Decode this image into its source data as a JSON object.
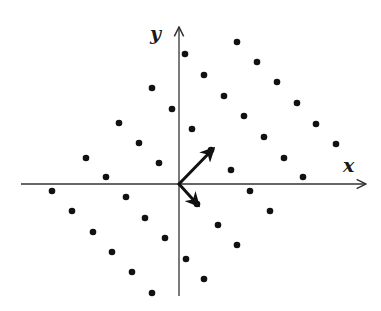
{
  "diagram": {
    "type": "lattice",
    "axes": {
      "x_label": "x",
      "y_label": "y",
      "origin": [
        179,
        184
      ],
      "x_axis": {
        "from": [
          21,
          184
        ],
        "to": [
          366,
          184
        ]
      },
      "y_axis": {
        "from": [
          179,
          296
        ],
        "to": [
          179,
          27
        ]
      }
    },
    "basis_vectors": [
      {
        "name": "v1",
        "from": [
          179,
          184
        ],
        "to": [
          213,
          149
        ]
      },
      {
        "name": "v2",
        "from": [
          179,
          184
        ],
        "to": [
          198,
          205
        ]
      }
    ],
    "points": [
      [
        185,
        54
      ],
      [
        237,
        42
      ],
      [
        204,
        75
      ],
      [
        257,
        62
      ],
      [
        224,
        96
      ],
      [
        277,
        82
      ],
      [
        244,
        116
      ],
      [
        297,
        103
      ],
      [
        264,
        137
      ],
      [
        316,
        124
      ],
      [
        284,
        158
      ],
      [
        336,
        144
      ],
      [
        303,
        177
      ],
      [
        152,
        88
      ],
      [
        172,
        109
      ],
      [
        192,
        129
      ],
      [
        211,
        150
      ],
      [
        231,
        170
      ],
      [
        250,
        191
      ],
      [
        270,
        211
      ],
      [
        119,
        123
      ],
      [
        139,
        143
      ],
      [
        159,
        163
      ],
      [
        218,
        225
      ],
      [
        237,
        245
      ],
      [
        86,
        158
      ],
      [
        106,
        177
      ],
      [
        126,
        197
      ],
      [
        145,
        218
      ],
      [
        165,
        238
      ],
      [
        186,
        259
      ],
      [
        204,
        279
      ],
      [
        52,
        191
      ],
      [
        72,
        211
      ],
      [
        93,
        232
      ],
      [
        112,
        252
      ],
      [
        132,
        272
      ],
      [
        152,
        293
      ],
      [
        197,
        204
      ]
    ],
    "colors": {
      "ink": "#111111",
      "axis": "#333333"
    }
  }
}
